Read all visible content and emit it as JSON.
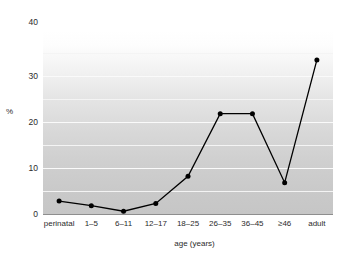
{
  "chart_data": {
    "type": "line",
    "title": "",
    "subtitle": "",
    "xlabel": "age (years)",
    "ylabel": "%",
    "categories": [
      "perinatal",
      "1–5",
      "6–11",
      "12–17",
      "18–25",
      "26–35",
      "36–45",
      "≥46",
      "adult"
    ],
    "values": [
      2.8,
      1.8,
      0.6,
      2.3,
      8.2,
      21.8,
      21.8,
      6.8,
      33.5
    ],
    "series": [
      {
        "name": "%",
        "values": [
          2.8,
          1.8,
          0.6,
          2.3,
          8.2,
          21.8,
          21.8,
          6.8,
          33.5
        ]
      }
    ],
    "ylim": [
      0,
      40
    ],
    "yticks": [
      0,
      10,
      20,
      30,
      40
    ],
    "ytick_labels": [
      "0",
      "10",
      "20",
      "30",
      "40"
    ],
    "minor_gridlines": [
      5,
      15,
      25,
      35
    ],
    "grid": true,
    "legend": "none",
    "marker": "filled-circle",
    "line_color": "#000000",
    "marker_color": "#000000",
    "plot_bg_top": "#ffffff",
    "plot_bg_bottom": "#c6c6c6",
    "gridline_color": "#f7f7f7",
    "axis_color": "#8e8e8e",
    "text_color": "#2b2b2b"
  }
}
